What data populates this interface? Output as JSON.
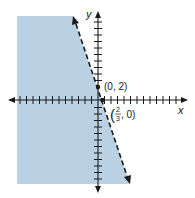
{
  "figure": {
    "type": "linear-inequality-graph",
    "axes": {
      "x_label": "x",
      "y_label": "y"
    },
    "boundary_line": {
      "style": "dashed",
      "points": [
        [
          0,
          2
        ],
        [
          0.6667,
          0
        ]
      ]
    },
    "shading": {
      "side": "left/below boundary",
      "color": "#b9d1e3"
    },
    "points": [
      {
        "label": "(0, 2)",
        "x": 0,
        "y": 2
      },
      {
        "label_num": "2",
        "label_den": "3",
        "label_rest": ", 0)",
        "label_open": "(",
        "x": 0.6667,
        "y": 0
      }
    ],
    "colors": {
      "shade": "#b9d1e3",
      "line": "#1a1a1a",
      "axis": "#1a1a1a"
    }
  }
}
